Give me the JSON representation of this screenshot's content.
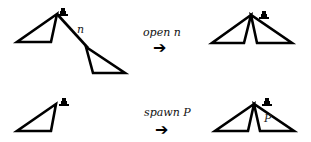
{
  "diagram": {
    "rows": [
      {
        "operation": "open n",
        "arrow": "➔",
        "before": {
          "description": "triangle with marker at apex, connected by edge n to a second hanging triangle",
          "edge_label": "n",
          "marker": "token-icon"
        },
        "after": {
          "description": "two triangles sharing an apex with marker",
          "marker": "token-icon"
        }
      },
      {
        "operation": "spawn P",
        "arrow": "➔",
        "before": {
          "description": "single triangle with marker at apex",
          "marker": "token-icon"
        },
        "after": {
          "description": "two triangles sharing an apex with marker; right triangle labeled P",
          "triangle_label": "P",
          "marker": "token-icon"
        }
      }
    ],
    "colors": {
      "stroke": "#000000",
      "background": "#ffffff"
    }
  }
}
